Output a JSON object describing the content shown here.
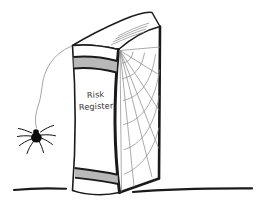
{
  "scene": {
    "title": "Risk Register book with spider and cobweb",
    "background_color": "#ffffff",
    "ink_color": "#1a1a1a",
    "band_color": "#b8b8b8",
    "web_color": "#888888",
    "thread_color": "#9a9a9a",
    "spider_color": "#000000"
  },
  "book": {
    "label_line_1": "Risk",
    "label_line_2": "Register",
    "label_color": "#3a3a3a",
    "spine_band_top_color": "#b8b8b8",
    "spine_band_bottom_color": "#b8b8b8"
  },
  "web": {
    "name": "cobweb",
    "radial_count": 7,
    "arc_count": 6
  },
  "spider": {
    "name": "spider",
    "leg_count": 8,
    "on_thread": true
  },
  "ground": {
    "line_left": "ground-line-left",
    "line_right": "ground-line-right"
  }
}
